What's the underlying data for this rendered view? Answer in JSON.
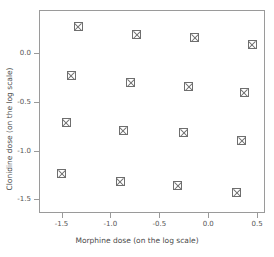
{
  "chart_data": {
    "type": "scatter",
    "title": "",
    "xlabel": "Morphine dose (on the log scale)",
    "ylabel": "Clonidine dose (on the log scale)",
    "xlim": [
      -1.73,
      0.58
    ],
    "ylim": [
      -1.64,
      0.44
    ],
    "grid": false,
    "legend": null,
    "marker": "square-with-cross",
    "marker_color": "#6e6e6e",
    "xticks": [
      -1.5,
      -1.0,
      -0.5,
      0.0,
      0.5
    ],
    "xticklabels": [
      "-1.5",
      "-1.0",
      "-0.5",
      "0.0",
      "0.5"
    ],
    "yticks": [
      0.0,
      -0.5,
      -1.0,
      -1.5
    ],
    "yticklabels": [
      "0.0",
      "-0.5",
      "-1.0",
      "-1.5"
    ],
    "points": [
      {
        "x": -1.34,
        "y": 0.28
      },
      {
        "x": -0.74,
        "y": 0.2
      },
      {
        "x": -0.15,
        "y": 0.17
      },
      {
        "x": 0.44,
        "y": 0.1
      },
      {
        "x": -1.41,
        "y": -0.22
      },
      {
        "x": -0.8,
        "y": -0.29
      },
      {
        "x": -0.21,
        "y": -0.33
      },
      {
        "x": 0.36,
        "y": -0.4
      },
      {
        "x": -1.46,
        "y": -0.7
      },
      {
        "x": -0.88,
        "y": -0.78
      },
      {
        "x": -0.26,
        "y": -0.81
      },
      {
        "x": 0.33,
        "y": -0.89
      },
      {
        "x": -1.51,
        "y": -1.23
      },
      {
        "x": -0.91,
        "y": -1.31
      },
      {
        "x": -0.32,
        "y": -1.35
      },
      {
        "x": 0.28,
        "y": -1.42
      }
    ]
  },
  "axes": {
    "x_title": "Morphine dose (on the log scale)",
    "y_title": "Clonidine dose (on the log scale)"
  }
}
